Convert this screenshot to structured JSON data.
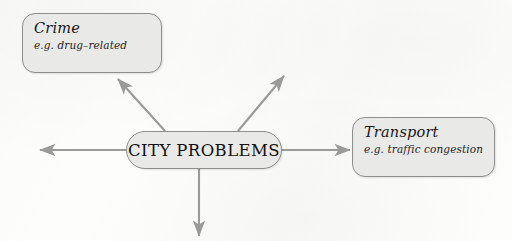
{
  "diagram": {
    "type": "mind-map",
    "central_topic": {
      "label": "CITY PROBLEMS",
      "shape": "stadium",
      "x": 126,
      "y": 131,
      "width": 156,
      "height": 38
    },
    "branches": [
      {
        "id": "crime",
        "title": "Crime",
        "example": "e.g. drug–related",
        "shape": "rounded-rect",
        "x": 22,
        "y": 13,
        "width": 140,
        "height": 60,
        "direction": "upper-left",
        "labelled": true
      },
      {
        "id": "transport",
        "title": "Transport",
        "example": "e.g. traffic congestion",
        "shape": "rounded-rect",
        "x": 352,
        "y": 117,
        "width": 143,
        "height": 60,
        "direction": "right",
        "labelled": true
      },
      {
        "id": "branch-upper-right",
        "title": "",
        "example": "",
        "direction": "upper-right",
        "labelled": false
      },
      {
        "id": "branch-left",
        "title": "",
        "example": "",
        "direction": "left",
        "labelled": false
      },
      {
        "id": "branch-down",
        "title": "",
        "example": "",
        "direction": "down",
        "labelled": false
      }
    ],
    "connectors": [
      {
        "id": "connector-to-crime",
        "from": [
          165,
          131
        ],
        "to": [
          118,
          79
        ],
        "head": "arrow"
      },
      {
        "id": "connector-upper-right",
        "from": [
          238,
          131
        ],
        "to": [
          284,
          76
        ],
        "head": "arrow"
      },
      {
        "id": "connector-to-transport",
        "from": [
          283,
          150
        ],
        "to": [
          350,
          150
        ],
        "head": "arrow"
      },
      {
        "id": "connector-left",
        "from": [
          126,
          150
        ],
        "to": [
          40,
          150
        ],
        "head": "arrow"
      },
      {
        "id": "connector-down",
        "from": [
          199,
          169
        ],
        "to": [
          199,
          236
        ],
        "head": "arrow"
      }
    ],
    "colors": {
      "node_fill": "#e9e9e7",
      "node_border": "#8e8e8c",
      "connector": "#9a9a98",
      "text": "#171717",
      "background": "#fdfdfc"
    }
  }
}
